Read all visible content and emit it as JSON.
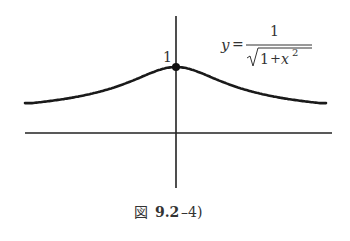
{
  "figure": {
    "function_label": {
      "lhs": "y",
      "eq": "=",
      "numerator": "1",
      "radicand_const": "1",
      "radicand_plus": "+",
      "radicand_var": "x",
      "radicand_exp": "2"
    },
    "peak_label": "1",
    "caption_prefix": "図",
    "caption_number": "9.2",
    "caption_suffix": "–4)"
  },
  "chart_data": {
    "type": "line",
    "title": "",
    "function": "y = 1/sqrt(1+x^2)",
    "xlabel": "",
    "ylabel": "",
    "xlim": [
      -3,
      3
    ],
    "ylim": [
      0,
      1
    ],
    "annotations": [
      {
        "x": 0,
        "y": 1,
        "label": "1",
        "marker": "dot"
      }
    ],
    "grid": false
  }
}
